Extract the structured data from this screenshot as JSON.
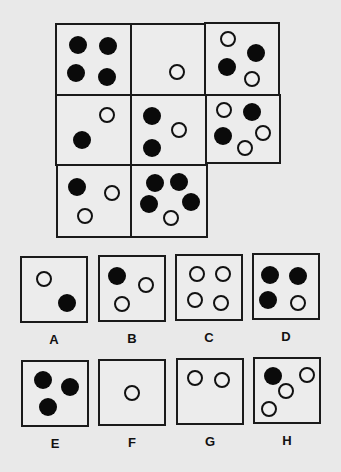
{
  "puzzle": {
    "matrix": {
      "cells": [
        {
          "x": 55,
          "y": 23,
          "w": 77,
          "h": 73,
          "dots": [
            {
              "c": "black",
              "x": 78,
              "y": 45
            },
            {
              "c": "black",
              "x": 108,
              "y": 46
            },
            {
              "c": "black",
              "x": 76,
              "y": 73
            },
            {
              "c": "black",
              "x": 107,
              "y": 77
            }
          ]
        },
        {
          "x": 130,
          "y": 23,
          "w": 76,
          "h": 73,
          "dots": [
            {
              "c": "white",
              "x": 177,
              "y": 72
            }
          ]
        },
        {
          "x": 204,
          "y": 22,
          "w": 76,
          "h": 74,
          "dots": [
            {
              "c": "white",
              "x": 228,
              "y": 39
            },
            {
              "c": "black",
              "x": 256,
              "y": 53
            },
            {
              "c": "black",
              "x": 227,
              "y": 67
            },
            {
              "c": "white",
              "x": 252,
              "y": 79
            }
          ]
        },
        {
          "x": 55,
          "y": 94,
          "w": 77,
          "h": 72,
          "dots": [
            {
              "c": "white",
              "x": 107,
              "y": 115
            },
            {
              "c": "black",
              "x": 82,
              "y": 140
            }
          ]
        },
        {
          "x": 130,
          "y": 94,
          "w": 77,
          "h": 72,
          "dots": [
            {
              "c": "black",
              "x": 152,
              "y": 116
            },
            {
              "c": "white",
              "x": 179,
              "y": 130
            },
            {
              "c": "black",
              "x": 152,
              "y": 148
            }
          ]
        },
        {
          "x": 205,
          "y": 94,
          "w": 76,
          "h": 70,
          "dots": [
            {
              "c": "white",
              "x": 224,
              "y": 110
            },
            {
              "c": "black",
              "x": 252,
              "y": 112
            },
            {
              "c": "black",
              "x": 223,
              "y": 136
            },
            {
              "c": "white",
              "x": 263,
              "y": 133
            },
            {
              "c": "white",
              "x": 245,
              "y": 148
            }
          ]
        },
        {
          "x": 56,
          "y": 164,
          "w": 76,
          "h": 74,
          "dots": [
            {
              "c": "black",
              "x": 77,
              "y": 187
            },
            {
              "c": "white",
              "x": 112,
              "y": 193
            },
            {
              "c": "white",
              "x": 85,
              "y": 216
            }
          ]
        },
        {
          "x": 130,
          "y": 164,
          "w": 78,
          "h": 74,
          "dots": [
            {
              "c": "black",
              "x": 155,
              "y": 183
            },
            {
              "c": "black",
              "x": 179,
              "y": 182
            },
            {
              "c": "black",
              "x": 149,
              "y": 204
            },
            {
              "c": "black",
              "x": 191,
              "y": 202
            },
            {
              "c": "white",
              "x": 171,
              "y": 218
            }
          ]
        }
      ]
    },
    "options": [
      {
        "label": "A",
        "x": 20,
        "y": 256,
        "label_y": 332,
        "dots": [
          {
            "c": "white",
            "x": 44,
            "y": 279
          },
          {
            "c": "black",
            "x": 67,
            "y": 303
          }
        ]
      },
      {
        "label": "B",
        "x": 98,
        "y": 255,
        "label_y": 331,
        "dots": [
          {
            "c": "black",
            "x": 117,
            "y": 276
          },
          {
            "c": "white",
            "x": 146,
            "y": 285
          },
          {
            "c": "white",
            "x": 122,
            "y": 304
          }
        ]
      },
      {
        "label": "C",
        "x": 175,
        "y": 254,
        "label_y": 330,
        "dots": [
          {
            "c": "white",
            "x": 197,
            "y": 274
          },
          {
            "c": "white",
            "x": 223,
            "y": 274
          },
          {
            "c": "white",
            "x": 195,
            "y": 300
          },
          {
            "c": "white",
            "x": 221,
            "y": 303
          }
        ]
      },
      {
        "label": "D",
        "x": 252,
        "y": 253,
        "label_y": 329,
        "dots": [
          {
            "c": "black",
            "x": 270,
            "y": 275
          },
          {
            "c": "black",
            "x": 298,
            "y": 276
          },
          {
            "c": "black",
            "x": 268,
            "y": 300
          },
          {
            "c": "white",
            "x": 298,
            "y": 303
          }
        ]
      },
      {
        "label": "E",
        "x": 21,
        "y": 360,
        "label_y": 436,
        "dots": [
          {
            "c": "black",
            "x": 43,
            "y": 380
          },
          {
            "c": "black",
            "x": 70,
            "y": 387
          },
          {
            "c": "black",
            "x": 48,
            "y": 407
          }
        ]
      },
      {
        "label": "F",
        "x": 98,
        "y": 359,
        "label_y": 435,
        "dots": [
          {
            "c": "white",
            "x": 132,
            "y": 393
          }
        ]
      },
      {
        "label": "G",
        "x": 176,
        "y": 358,
        "label_y": 434,
        "dots": [
          {
            "c": "white",
            "x": 195,
            "y": 378
          },
          {
            "c": "white",
            "x": 222,
            "y": 380
          }
        ]
      },
      {
        "label": "H",
        "x": 253,
        "y": 357,
        "label_y": 433,
        "dots": [
          {
            "c": "black",
            "x": 273,
            "y": 376
          },
          {
            "c": "white",
            "x": 307,
            "y": 375
          },
          {
            "c": "white",
            "x": 286,
            "y": 391
          },
          {
            "c": "white",
            "x": 269,
            "y": 409
          }
        ]
      }
    ]
  }
}
